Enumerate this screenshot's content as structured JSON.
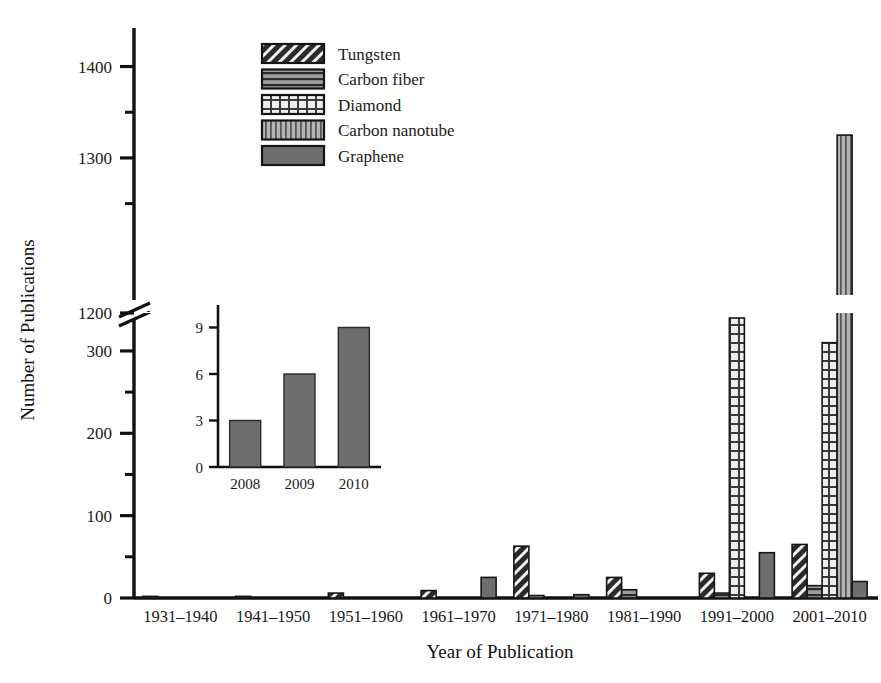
{
  "chart_data": {
    "type": "bar",
    "title": "",
    "xlabel": "Year of Publication",
    "ylabel": "Number of Publications",
    "categories": [
      "1931–1940",
      "1941–1950",
      "1951–1960",
      "1961–1970",
      "1971–1980",
      "1981–1990",
      "1991–2000",
      "2001–2010"
    ],
    "series": [
      {
        "name": "Tungsten",
        "pattern": "diagonal-hatch",
        "color": "#2b2b2b",
        "values": [
          2,
          2,
          6,
          9,
          63,
          25,
          30,
          65
        ]
      },
      {
        "name": "Carbon fiber",
        "pattern": "horizontal-lines",
        "color": "#8a8a8a",
        "values": [
          0,
          0,
          0,
          0,
          3,
          10,
          6,
          15
        ]
      },
      {
        "name": "Diamond",
        "pattern": "cross-hatch",
        "color": "#d9d9d9",
        "values": [
          0,
          0,
          0,
          0,
          0,
          0,
          340,
          310
        ]
      },
      {
        "name": "Carbon nanotube",
        "pattern": "vertical-lines",
        "color": "#9a9a9a",
        "values": [
          0,
          0,
          0,
          0,
          0,
          0,
          0,
          1325
        ]
      },
      {
        "name": "Graphene",
        "pattern": "solid",
        "color": "#6e6e6e",
        "values": [
          0,
          0,
          0,
          25,
          4,
          0,
          55,
          20
        ]
      }
    ],
    "yticks_labeled": [
      0,
      100,
      200,
      300,
      1200,
      1300,
      1400
    ],
    "yticks_minor": [
      50,
      150,
      250,
      1250,
      1350
    ],
    "ylim_lower": [
      0,
      340
    ],
    "ylim_upper": [
      1150,
      1440
    ],
    "axis_break": true,
    "axis_break_label": "1200",
    "grid": false,
    "legend_position": "top-center"
  },
  "inset_chart": {
    "type": "bar",
    "categories": [
      "2008",
      "2009",
      "2010"
    ],
    "values": [
      3,
      6,
      9
    ],
    "yticks": [
      0,
      3,
      6,
      9
    ],
    "ylim": [
      0,
      10
    ],
    "series_name": "Graphene",
    "color": "#6e6e6e",
    "xlabel": "",
    "ylabel": ""
  },
  "legend": {
    "items": [
      {
        "label": "Tungsten",
        "swatch": "diagonal-hatch-swatch"
      },
      {
        "label": "Carbon fiber",
        "swatch": "horizontal-lines-swatch"
      },
      {
        "label": "Diamond",
        "swatch": "cross-hatch-swatch"
      },
      {
        "label": "Carbon nanotube",
        "swatch": "vertical-lines-swatch"
      },
      {
        "label": "Graphene",
        "swatch": "solid-swatch"
      }
    ]
  },
  "colors": {
    "axis": "#111111",
    "background": "#ffffff",
    "graphene": "#6e6e6e",
    "tungsten": "#2b2b2b"
  }
}
